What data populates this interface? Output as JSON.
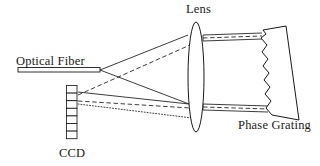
{
  "figure": {
    "type": "optical-system-schematic",
    "background_color": "#ffffff",
    "stroke_color": "#1a1a1a",
    "width": 320,
    "height": 166
  },
  "labels": {
    "optical_fiber": "Optical Fiber",
    "lens": "Lens",
    "phase_grating": "Phase Grating",
    "ccd": "CCD"
  },
  "components": {
    "optical_fiber": {
      "name": "Optical Fiber",
      "shape": "thin-horizontal-bar",
      "x1": 18,
      "y1": 67,
      "x2": 100,
      "y2": 73
    },
    "ccd": {
      "name": "CCD",
      "shape": "vertical-pixel-array",
      "cells": 7,
      "x": 66,
      "y": 85,
      "cell_width": 11,
      "cell_height": 8
    },
    "lens": {
      "name": "Lens",
      "shape": "biconvex-ellipse",
      "cx": 196,
      "cy": 77,
      "rx": 8,
      "ry": 55
    },
    "phase_grating": {
      "name": "Phase Grating",
      "shape": "tilted-trapezoid-with-sawtooth-edge",
      "teeth": 11,
      "top_left_x": 264,
      "top_left_y": 31,
      "bottom_left_x": 272,
      "bottom_left_y": 108
    }
  },
  "rays": {
    "legend": [
      "solid",
      "dashed",
      "dotted"
    ],
    "description": "Diverging beam from fiber tip through lens to phase grating, diffracted back through lens onto CCD array"
  }
}
